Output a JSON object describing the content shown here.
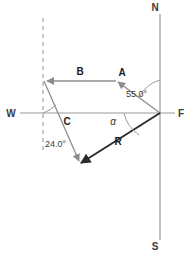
{
  "figure": {
    "kind": "vector-diagram",
    "background_color": "#ffffff",
    "axis_color": "#9a9a9a",
    "vector_color": "#8c8c8c",
    "resultant_color": "#2b2b2b",
    "dashed_color": "#9a9a9a",
    "arc_color": "#9a9a9a",
    "label_color": "#3b3b3b"
  },
  "compass": {
    "north": "N",
    "south": "S",
    "west": "W",
    "origin": "F"
  },
  "vectors": [
    {
      "name": "vector-a",
      "label": "A",
      "from": {
        "x": 160,
        "y": 113
      },
      "to": {
        "x": 116,
        "y": 81
      },
      "arrow_at": "to",
      "style": "thin"
    },
    {
      "name": "vector-b",
      "label": "B",
      "from": {
        "x": 116,
        "y": 81
      },
      "to": {
        "x": 44,
        "y": 81
      },
      "arrow_at": "to",
      "style": "thin"
    },
    {
      "name": "vector-c",
      "label": "C",
      "from": {
        "x": 44,
        "y": 81
      },
      "to": {
        "x": 80,
        "y": 164
      },
      "arrow_at": "to",
      "style": "thin"
    },
    {
      "name": "vector-r",
      "label": "R",
      "from": {
        "x": 160,
        "y": 113
      },
      "to": {
        "x": 78,
        "y": 165
      },
      "arrow_at": "to",
      "style": "bold"
    }
  ],
  "angles": [
    {
      "name": "angle-55",
      "label": "55.0°",
      "label_x": 126,
      "label_y": 94,
      "vertex": {
        "x": 160,
        "y": 113
      },
      "description": "between north axis and vector A"
    },
    {
      "name": "angle-alpha",
      "label": "α",
      "label_x": 113,
      "label_y": 122,
      "vertex": {
        "x": 160,
        "y": 113
      },
      "description": "between west-east axis and resultant R"
    },
    {
      "name": "angle-24",
      "label": "24.0°",
      "label_x": 46,
      "label_y": 144,
      "vertex": {
        "x": 44,
        "y": 81
      },
      "description": "between dashed vertical reference and vector C"
    }
  ],
  "guides": {
    "dashed_vertical": {
      "name": "dashed-reference-line",
      "x": 43,
      "y_top": 18,
      "y_bottom": 152
    },
    "north_south_axis": {
      "x": 160,
      "y_top": 14,
      "y_bottom": 240
    },
    "west_east_axis": {
      "y": 113,
      "x_left": 20,
      "x_right": 175
    }
  }
}
